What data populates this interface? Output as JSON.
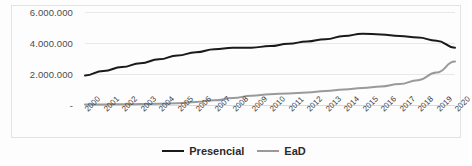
{
  "chart_data": {
    "type": "line",
    "title": "",
    "subtitle": "",
    "xlabel": "",
    "ylabel": "",
    "grid": true,
    "legend_position": "bottom-center",
    "ylim": [
      0,
      6000000
    ],
    "y_ticks": [
      0,
      2000000,
      4000000,
      6000000
    ],
    "y_tick_labels": [
      "-",
      "2.000.000",
      "4.000.000",
      "6.000.000"
    ],
    "categories": [
      "2000",
      "2001",
      "2002",
      "2003",
      "2004",
      "2005",
      "2006",
      "2007",
      "2008",
      "2009",
      "2010",
      "2011",
      "2012",
      "2013",
      "2014",
      "2015",
      "2016",
      "2017",
      "2018",
      "2019",
      "2020"
    ],
    "series": [
      {
        "name": "Presencial",
        "color": "#1a1a1a",
        "values": [
          1900000,
          2200000,
          2450000,
          2700000,
          2950000,
          3200000,
          3400000,
          3600000,
          3700000,
          3700000,
          3800000,
          3950000,
          4100000,
          4250000,
          4450000,
          4600000,
          4550000,
          4450000,
          4350000,
          4150000,
          3700000
        ]
      },
      {
        "name": "EaD",
        "color": "#9a9a9a",
        "values": [
          30000,
          40000,
          50000,
          60000,
          80000,
          120000,
          200000,
          300000,
          450000,
          600000,
          700000,
          750000,
          800000,
          900000,
          1000000,
          1100000,
          1200000,
          1350000,
          1600000,
          2100000,
          2800000
        ]
      }
    ]
  },
  "legend": {
    "items": [
      {
        "label": "Presencial",
        "color": "#1a1a1a"
      },
      {
        "label": "EaD",
        "color": "#9a9a9a"
      }
    ]
  }
}
